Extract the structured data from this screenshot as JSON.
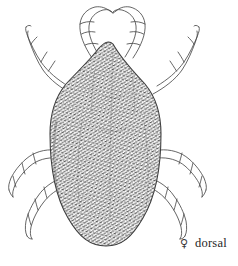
{
  "figure": {
    "view": "dorsal",
    "sex": "female",
    "background_color": "#ffffff",
    "ink_color": "#3d3d3d",
    "stipple_color": "#4a4a4a",
    "width_px": 238,
    "height_px": 266
  },
  "caption": {
    "sex_symbol": "♀",
    "sex_symbol_name": "female-symbol",
    "view_label": "dorsal",
    "x_px": 180,
    "y_px": 237
  },
  "anatomy": {
    "body": {
      "name": "idiosoma",
      "shape": "ovoid-with-pointed-anterior-apex",
      "apex_x": 113,
      "apex_y": 44,
      "left_edge_x": 50,
      "right_edge_x": 161,
      "bottom_y": 246,
      "widest_y": 150,
      "texture": "dense-punctate-stipple"
    },
    "legs": [
      {
        "id": "leg-1-left",
        "side": "left",
        "pair": 1,
        "label": "leg I left",
        "orientation": "anterior-curving-up-and-inward",
        "segments": 5
      },
      {
        "id": "leg-1-right",
        "side": "right",
        "pair": 1,
        "label": "leg I right",
        "orientation": "anterior-curving-up-and-inward",
        "segments": 5
      },
      {
        "id": "leg-2-left",
        "side": "left",
        "pair": 2,
        "label": "leg II left",
        "orientation": "anterolateral-upper-left",
        "segments": 5
      },
      {
        "id": "leg-2-right",
        "side": "right",
        "pair": 2,
        "label": "leg II right",
        "orientation": "anterolateral-upper-right",
        "segments": 5
      },
      {
        "id": "leg-3-left",
        "side": "left",
        "pair": 3,
        "label": "leg III left",
        "orientation": "posterolateral-mid-left",
        "segments": 5
      },
      {
        "id": "leg-3-right",
        "side": "right",
        "pair": 3,
        "label": "leg III right",
        "orientation": "posterolateral-mid-right",
        "segments": 5
      },
      {
        "id": "leg-4-left",
        "side": "left",
        "pair": 4,
        "label": "leg IV left",
        "orientation": "posterior-lower-left",
        "segments": 5
      },
      {
        "id": "leg-4-right",
        "side": "right",
        "pair": 4,
        "label": "leg IV right",
        "orientation": "posterior-lower-right",
        "segments": 5
      }
    ]
  }
}
